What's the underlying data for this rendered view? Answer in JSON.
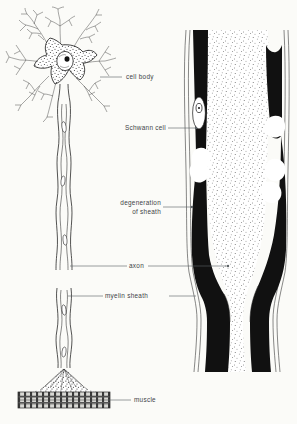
{
  "figure": {
    "width": 297,
    "height": 424,
    "background_color": "#fbfbf8",
    "ink_color": "#111111",
    "label_color": "#3d4347",
    "leader_color": "#5b6165"
  },
  "labels": {
    "cell_body": "cell body",
    "schwann_cell": "Schwann cell",
    "degeneration_line1": "degeneration",
    "degeneration_line2": "of sheath",
    "axon": "axon",
    "myelin_sheath": "myelin sheath",
    "muscle": "muscle"
  },
  "panels": {
    "left": {
      "name": "whole-neuron-view",
      "parts": [
        "dendrites",
        "cell-body",
        "nucleus",
        "nucleolus",
        "axon",
        "myelin-sheath",
        "schwann-cell-nuclei",
        "motor-endplate",
        "muscle-fiber"
      ]
    },
    "right": {
      "name": "enlarged-nerve-fiber-view",
      "parts": [
        "outer-sheath-membrane",
        "myelin-band-left",
        "myelin-band-right",
        "stippled-axoplasm",
        "schwann-cell-nucleus",
        "degeneration-gap-upper-left",
        "degeneration-gap-upper-right",
        "degeneration-gap-mid-left",
        "degeneration-gap-mid-right",
        "node-of-ranvier"
      ]
    }
  }
}
